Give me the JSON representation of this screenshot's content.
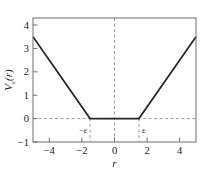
{
  "chart_data": {
    "type": "line",
    "title": "",
    "xlabel": "r",
    "ylabel": "Vε(r)",
    "ylabel_base": "V",
    "ylabel_sub": "ε",
    "ylabel_arg": "(r)",
    "xlim": [
      -5.0,
      5.0
    ],
    "ylim": [
      -1.0,
      4.3
    ],
    "xticks": [
      -4,
      -2,
      0,
      2,
      4
    ],
    "xticklabels": [
      "−4",
      "−2",
      "0",
      "2",
      "4"
    ],
    "yticks": [
      -1,
      0,
      1,
      2,
      3,
      4
    ],
    "yticklabels": [
      "−1",
      "0",
      "1",
      "2",
      "3",
      "4"
    ],
    "grid": false,
    "legend": null,
    "epsilon": 1.5,
    "annotations": [
      {
        "name": "neg-epsilon-label",
        "text": "−ε",
        "x": -1.5,
        "y": -0.62
      },
      {
        "name": "pos-epsilon-label",
        "text": "ε",
        "x": 1.5,
        "y": -0.62
      }
    ],
    "guides": [
      {
        "name": "zero-horizontal-guide",
        "orientation": "horizontal",
        "value": 0
      },
      {
        "name": "zero-vertical-guide",
        "orientation": "vertical",
        "value": 0
      },
      {
        "name": "neg-epsilon-vertical-guide",
        "orientation": "vertical",
        "value": -1.5
      },
      {
        "name": "pos-epsilon-vertical-guide",
        "orientation": "vertical",
        "value": 1.5
      }
    ],
    "series": [
      {
        "name": "epsilon-insensitive-loss",
        "color": "#262626",
        "x": [
          -5.0,
          -1.5,
          1.5,
          5.0
        ],
        "values": [
          3.5,
          0.0,
          0.0,
          3.5
        ]
      }
    ]
  },
  "colors": {
    "curve": "#262626",
    "frame": "#6e6e6e",
    "guide": "#9a9a9a",
    "text": "#1a1a1a",
    "background": "#ffffff"
  }
}
